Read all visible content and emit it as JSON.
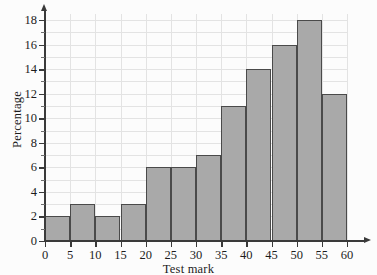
{
  "chart_data": {
    "type": "bar",
    "title": "",
    "subtitle": "",
    "xlabel": "Test mark",
    "ylabel": "Percentage",
    "categories": [
      "0-5",
      "5-10",
      "10-15",
      "15-20",
      "20-25",
      "25-30",
      "30-35",
      "35-40",
      "40-45",
      "45-50",
      "50-55",
      "55-60"
    ],
    "bin_edges": [
      0,
      5,
      10,
      15,
      20,
      25,
      30,
      35,
      40,
      45,
      50,
      55,
      60
    ],
    "values": [
      2,
      3,
      2,
      3,
      6,
      6,
      7,
      11,
      14,
      16,
      18,
      12
    ],
    "xlim": [
      0,
      60
    ],
    "ylim": [
      0,
      18
    ],
    "x_ticks": [
      0,
      5,
      10,
      15,
      20,
      25,
      30,
      35,
      40,
      45,
      50,
      55,
      60
    ],
    "y_ticks": [
      0,
      2,
      4,
      6,
      8,
      10,
      12,
      14,
      16,
      18
    ],
    "y_minor_tick_step": 1,
    "grid": true,
    "legend": "none",
    "annotations": [],
    "colors": {
      "bar_fill": "#a9a9a9",
      "bar_edge": "#4a4a4a",
      "grid": "#e3e3e3",
      "axis": "#3a3a3a",
      "background": "#fcfcfc",
      "text": "#1c1c1c"
    }
  }
}
